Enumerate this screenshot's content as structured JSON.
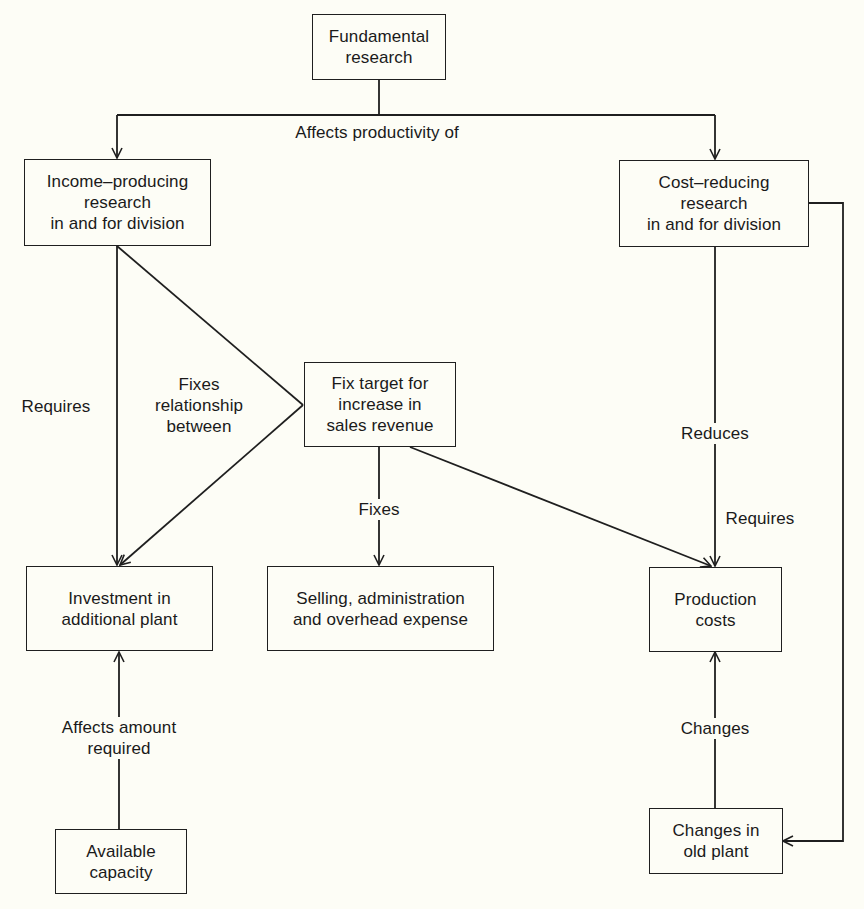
{
  "colors": {
    "background": "#fdfdf6",
    "ink": "#1a1a1a"
  },
  "nodes": {
    "fundamental_research": [
      "Fundamental",
      "research"
    ],
    "income_producing": [
      "Income–producing",
      "research",
      "in and for division"
    ],
    "cost_reducing": [
      "Cost–reducing",
      "research",
      "in and for division"
    ],
    "fix_target": [
      "Fix target for",
      "increase in",
      "sales revenue"
    ],
    "investment": [
      "Investment in",
      "additional plant"
    ],
    "selling": [
      "Selling, administration",
      "and overhead expense"
    ],
    "production_costs": [
      "Production",
      "costs"
    ],
    "available_capacity": [
      "Available",
      "capacity"
    ],
    "changes_old_plant": [
      "Changes in",
      "old plant"
    ]
  },
  "edges": {
    "affects_productivity": [
      "Affects productivity of"
    ],
    "requires_left": [
      "Requires"
    ],
    "fixes_relationship": [
      "Fixes",
      "relationship",
      "between"
    ],
    "fixes": [
      "Fixes"
    ],
    "reduces": [
      "Reduces"
    ],
    "requires_right": [
      "Requires"
    ],
    "affects_amount": [
      "Affects amount",
      "required"
    ],
    "changes": [
      "Changes"
    ]
  }
}
